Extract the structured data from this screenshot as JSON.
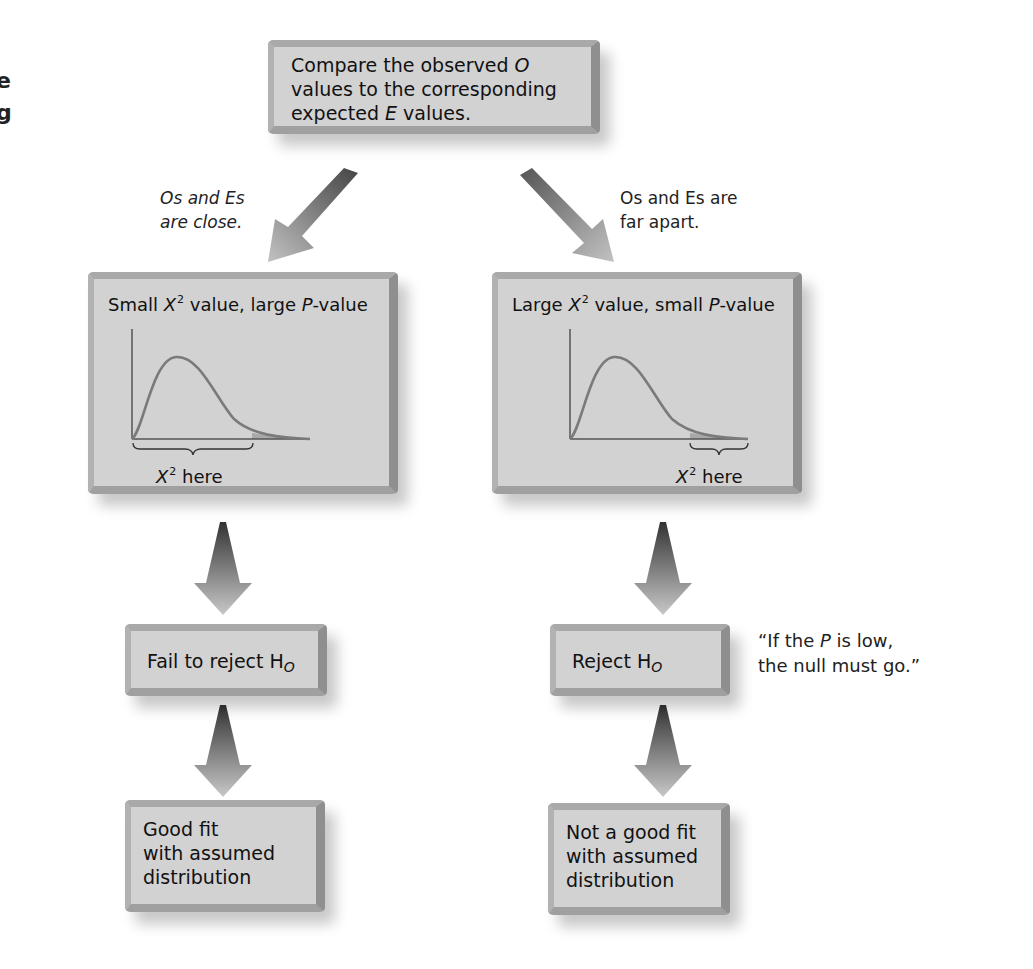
{
  "edge_fragments": [
    "e",
    "g"
  ],
  "top_box": {
    "line1_a": "Compare the observed ",
    "line1_b": "O",
    "line2": "values to the corresponding",
    "line3_a": "expected ",
    "line3_b": "E",
    "line3_c": " values."
  },
  "branch_labels": {
    "left_line1": "Os and Es",
    "left_line2": "are close.",
    "right_line1": "Os and Es are",
    "right_line2": "far apart."
  },
  "left_panel": {
    "title_a": "Small ",
    "title_x": "X",
    "title_sup": "2",
    "title_b": " value, large ",
    "title_p": "P",
    "title_c": "-value",
    "axis_label_x": "X",
    "axis_label_sup": "2",
    "axis_label_rest": " here"
  },
  "right_panel": {
    "title_a": "Large ",
    "title_x": "X",
    "title_sup": "2",
    "title_b": " value, small ",
    "title_p": "P",
    "title_c": "-value",
    "axis_label_x": "X",
    "axis_label_sup": "2",
    "axis_label_rest": " here"
  },
  "left_decision": {
    "text": "Fail to reject H",
    "sub": "O"
  },
  "right_decision": {
    "text": "Reject H",
    "sub": "O"
  },
  "mnemonic": {
    "line1_a": "“If the ",
    "line1_p": "P",
    "line1_b": " is low,",
    "line2": "the null must go.”"
  },
  "left_conclusion": {
    "line1": "Good fit",
    "line2": "with assumed",
    "line3": "distribution"
  },
  "right_conclusion": {
    "line1": "Not a good fit",
    "line2": "with assumed",
    "line3": "distribution"
  },
  "colors": {
    "box_fill": "#d2d2d2",
    "curve": "#7a7a7a",
    "shaded_tail": "#a8a8a8",
    "arrow_dark": "#555555",
    "arrow_light": "#bbbbbb"
  }
}
